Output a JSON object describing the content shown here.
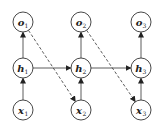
{
  "diagram": {
    "title": "",
    "nodes": [
      {
        "id": "o1",
        "base": "o",
        "sub": "1",
        "cx": 23,
        "cy": 22
      },
      {
        "id": "o2",
        "base": "o",
        "sub": "2",
        "cx": 81,
        "cy": 22
      },
      {
        "id": "o3",
        "base": "o",
        "sub": "3",
        "cx": 141,
        "cy": 22
      },
      {
        "id": "h1",
        "base": "h",
        "sub": "1",
        "cx": 23,
        "cy": 68
      },
      {
        "id": "h2",
        "base": "h",
        "sub": "2",
        "cx": 81,
        "cy": 68
      },
      {
        "id": "h3",
        "base": "h",
        "sub": "3",
        "cx": 141,
        "cy": 68
      },
      {
        "id": "x1",
        "base": "x",
        "sub": "1",
        "cx": 23,
        "cy": 110
      },
      {
        "id": "x2",
        "base": "x",
        "sub": "2",
        "cx": 81,
        "cy": 110
      },
      {
        "id": "x3",
        "base": "x",
        "sub": "3",
        "cx": 141,
        "cy": 110
      }
    ],
    "edges": [
      {
        "from": "x1",
        "to": "h1",
        "style": "solid"
      },
      {
        "from": "x2",
        "to": "h2",
        "style": "solid"
      },
      {
        "from": "x3",
        "to": "h3",
        "style": "solid"
      },
      {
        "from": "h1",
        "to": "o1",
        "style": "solid"
      },
      {
        "from": "h2",
        "to": "o2",
        "style": "solid"
      },
      {
        "from": "h3",
        "to": "o3",
        "style": "solid"
      },
      {
        "from": "h1",
        "to": "h2",
        "style": "solid"
      },
      {
        "from": "h2",
        "to": "h3",
        "style": "solid"
      },
      {
        "from": "o1",
        "to": "x2",
        "style": "dashed"
      },
      {
        "from": "o2",
        "to": "x3",
        "style": "dashed"
      }
    ],
    "colors": {
      "stroke": "#333333",
      "fill": "#ffffff"
    }
  }
}
